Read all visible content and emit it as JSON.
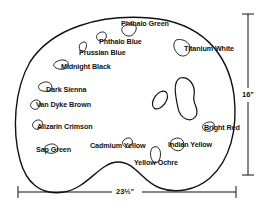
{
  "figure": {
    "type": "painter's palette layout diagram",
    "paints": [
      {
        "id": "phthalo-green",
        "label": "Phthalo Green"
      },
      {
        "id": "phthalo-blue",
        "label": "Phthalo Blue"
      },
      {
        "id": "prussian-blue",
        "label": "Prussian Blue"
      },
      {
        "id": "midnight-black",
        "label": "Midnight Black"
      },
      {
        "id": "titanium-white",
        "label": "Titanium White"
      },
      {
        "id": "dark-sienna",
        "label": "Dark Sienna"
      },
      {
        "id": "van-dyke-brown",
        "label": "Van Dyke Brown"
      },
      {
        "id": "alizarin-crimson",
        "label": "Alizarin Crimson"
      },
      {
        "id": "sap-green",
        "label": "Sap Green"
      },
      {
        "id": "cadmium-yellow",
        "label": "Cadmium Yellow"
      },
      {
        "id": "yellow-ochre",
        "label": "Yellow Ochre"
      },
      {
        "id": "indian-yellow",
        "label": "Indian Yellow"
      },
      {
        "id": "bright-red",
        "label": "Bright Red"
      }
    ],
    "dimensions": {
      "height": "16\"",
      "width": "23½\""
    }
  }
}
